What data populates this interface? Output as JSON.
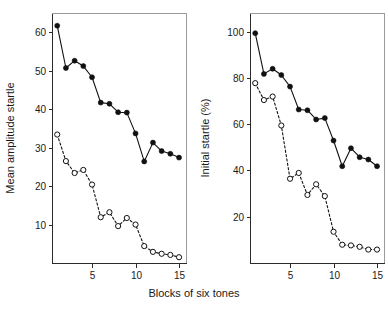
{
  "figure": {
    "background_color": "#ffffff",
    "ink_color": "#111111",
    "frame_color": "#9a9a9a",
    "shared_xlabel": "Blocks of six tones"
  },
  "chart_data": [
    {
      "type": "line",
      "panel": "left",
      "title": "",
      "xlabel": "Blocks of six tones",
      "ylabel": "Mean amplitude startle",
      "xlim": [
        0.4,
        15.8
      ],
      "ylim": [
        0,
        65
      ],
      "xticks": [
        5,
        10,
        15
      ],
      "xtick_labels": [
        "5",
        "10",
        "15"
      ],
      "yticks": [
        10,
        20,
        30,
        40,
        50,
        60
      ],
      "ytick_labels": [
        "10",
        "20",
        "30",
        "40",
        "50",
        "60"
      ],
      "grid": false,
      "legend": "none",
      "x": [
        1,
        2,
        3,
        4,
        5,
        6,
        7,
        8,
        9,
        10,
        11,
        12,
        13,
        14,
        15
      ],
      "series": [
        {
          "name": "filled-circles-solid",
          "marker": "filled-circle",
          "linestyle": "solid",
          "values": [
            61.7,
            50.7,
            52.6,
            51.2,
            48.3,
            41.7,
            41.4,
            39.2,
            39.1,
            33.7,
            26.4,
            31.3,
            29.1,
            28.4,
            27.4
          ]
        },
        {
          "name": "open-circles-dashed",
          "marker": "open-circle",
          "linestyle": "dashed",
          "values": [
            33.4,
            26.5,
            23.4,
            24.2,
            20.4,
            11.9,
            13.2,
            9.6,
            11.7,
            10.0,
            4.4,
            2.9,
            2.4,
            2.1,
            1.5
          ]
        }
      ]
    },
    {
      "type": "line",
      "panel": "right",
      "title": "",
      "xlabel": "Blocks of six tones",
      "ylabel": "Initial startle (%)",
      "xlim": [
        0.4,
        15.8
      ],
      "ylim": [
        0,
        108
      ],
      "xticks": [
        5,
        10,
        15
      ],
      "xtick_labels": [
        "5",
        "10",
        "15"
      ],
      "yticks": [
        20,
        40,
        60,
        80,
        100
      ],
      "ytick_labels": [
        "20",
        "40",
        "60",
        "80",
        "100"
      ],
      "grid": false,
      "legend": "none",
      "x": [
        1,
        2,
        3,
        4,
        5,
        6,
        7,
        8,
        9,
        10,
        11,
        12,
        13,
        14,
        15
      ],
      "series": [
        {
          "name": "filled-circles-solid",
          "marker": "filled-circle",
          "linestyle": "solid",
          "values": [
            99.3,
            81.7,
            83.9,
            81.2,
            76.2,
            66.3,
            66.0,
            62.0,
            62.6,
            52.9,
            41.8,
            49.6,
            45.7,
            44.7,
            41.8
          ]
        },
        {
          "name": "open-circles-dashed",
          "marker": "open-circle",
          "linestyle": "dashed",
          "values": [
            77.7,
            70.4,
            71.9,
            59.4,
            36.4,
            38.9,
            29.4,
            34.0,
            28.9,
            13.5,
            7.9,
            7.6,
            7.0,
            5.8,
            5.8
          ]
        }
      ]
    }
  ]
}
